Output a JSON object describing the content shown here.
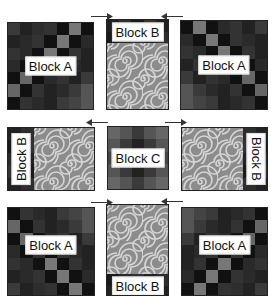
{
  "blocks": {
    "top_left": {
      "label": "Block A"
    },
    "top_center": {
      "label": "Block B"
    },
    "top_right": {
      "label": "Block A"
    },
    "middle_left": {
      "label": "Block B"
    },
    "middle_center": {
      "label": "Block C"
    },
    "middle_right": {
      "label": "Block B"
    },
    "bottom_left": {
      "label": "Block A"
    },
    "bottom_center": {
      "label": "Block B"
    },
    "bottom_right": {
      "label": "Block A"
    }
  },
  "arrows": [
    {
      "id": "top-left-arrow",
      "direction": "right"
    },
    {
      "id": "top-right-arrow",
      "direction": "left"
    },
    {
      "id": "middle-left-arrow",
      "direction": "left"
    },
    {
      "id": "middle-right-arrow",
      "direction": "right"
    },
    {
      "id": "bottom-left-arrow",
      "direction": "right"
    },
    {
      "id": "bottom-right-arrow",
      "direction": "left"
    }
  ],
  "colors": {
    "dark": "#151515",
    "mid": "#3a3a3a",
    "light": "#7a7a7a",
    "swirl": "#8a8a8a"
  }
}
